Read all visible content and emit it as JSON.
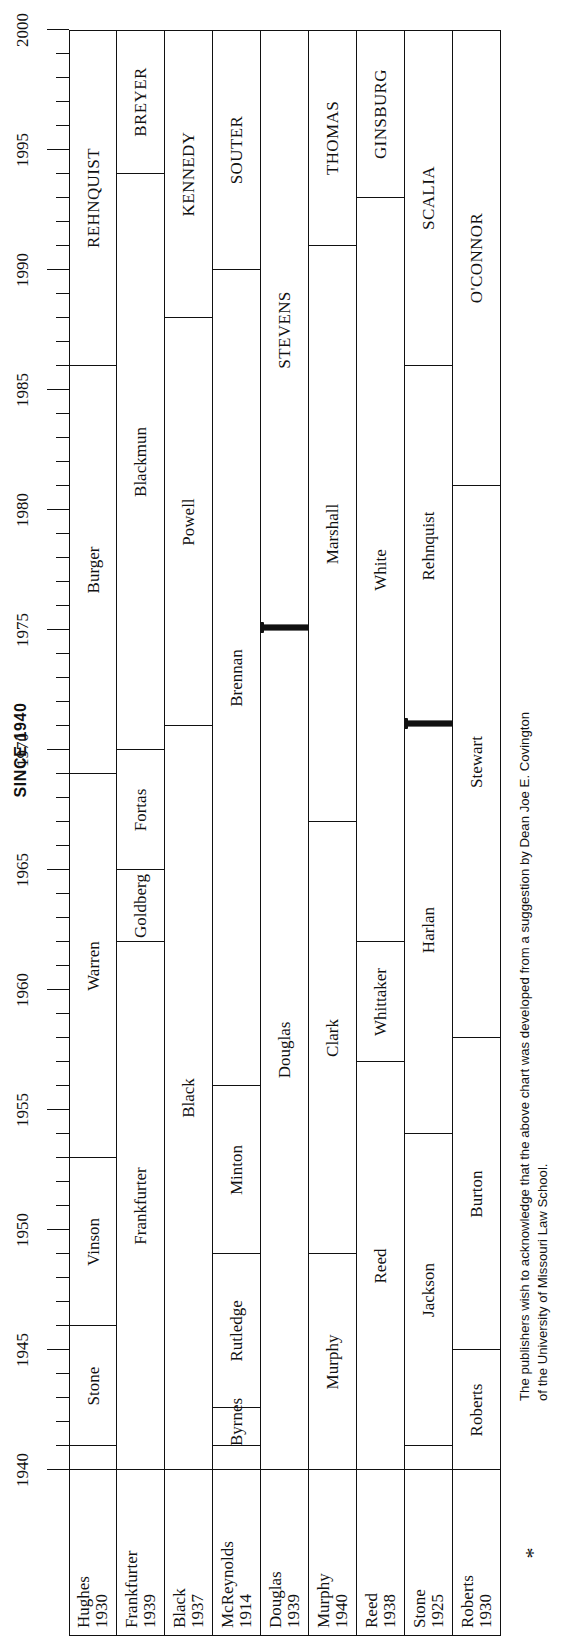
{
  "title": "SINCE 1940",
  "asterisk": "*",
  "footnote": "The publishers wish to acknowledge that the above chart was developed from a suggestion by Dean Joe E. Covington of the University of Missouri Law School.",
  "colors": {
    "ink": "#111111",
    "paper": "#ffffff"
  },
  "chart_data": {
    "type": "table",
    "title": "SINCE 1940",
    "xlabel": "",
    "ylabel": "",
    "xlim": [
      1940,
      2000
    ],
    "grid": false,
    "legend": "none",
    "x_major_ticks": [
      1940,
      1945,
      1950,
      1955,
      1960,
      1965,
      1970,
      1975,
      1980,
      1985,
      1990,
      1995,
      2000
    ],
    "x_minor_tick_step": 1,
    "tick_labels": [
      "1940",
      "1945",
      "1950",
      "1955",
      "1960",
      "1965",
      "1970",
      "1975",
      "1980",
      "1985",
      "1990",
      "1995",
      "2000"
    ],
    "seat_label_header": [
      "justice",
      "appointed"
    ],
    "series": [
      {
        "name": "Seat 1",
        "label_name": "Hughes",
        "label_year": "1930",
        "terms": [
          {
            "name": "Hughes",
            "start": 1940,
            "end": 1941,
            "style": "normal",
            "label_shown": false
          },
          {
            "name": "Stone",
            "start": 1941,
            "end": 1946,
            "style": "normal"
          },
          {
            "name": "Vinson",
            "start": 1946,
            "end": 1953,
            "style": "normal"
          },
          {
            "name": "Warren",
            "start": 1953,
            "end": 1969,
            "style": "normal"
          },
          {
            "name": "Burger",
            "start": 1969,
            "end": 1986,
            "style": "normal"
          },
          {
            "name": "REHNQUIST",
            "start": 1986,
            "end": 2000,
            "style": "caps"
          }
        ]
      },
      {
        "name": "Seat 2",
        "label_name": "Frankfurter",
        "label_year": "1939",
        "terms": [
          {
            "name": "Frankfurter",
            "start": 1940,
            "end": 1962,
            "style": "normal",
            "label_shown": false
          },
          {
            "name": "Goldberg",
            "start": 1962,
            "end": 1965,
            "style": "normal"
          },
          {
            "name": "Fortas",
            "start": 1965,
            "end": 1970,
            "style": "normal"
          },
          {
            "name": "Blackmun",
            "start": 1970,
            "end": 1994,
            "style": "normal"
          },
          {
            "name": "BREYER",
            "start": 1994,
            "end": 2000,
            "style": "caps"
          }
        ]
      },
      {
        "name": "Seat 3",
        "label_name": "Black",
        "label_year": "1937",
        "terms": [
          {
            "name": "Black",
            "start": 1940,
            "end": 1971,
            "style": "normal",
            "label_shown": false
          },
          {
            "name": "Powell",
            "start": 1971,
            "end": 1988,
            "style": "normal"
          },
          {
            "name": "KENNEDY",
            "start": 1988,
            "end": 2000,
            "style": "caps"
          }
        ]
      },
      {
        "name": "Seat 4",
        "label_name": "McReynolds",
        "label_year": "1914",
        "terms": [
          {
            "name": "McReynolds",
            "start": 1940,
            "end": 1941,
            "style": "normal"
          },
          {
            "name": "Byrnes",
            "start": 1941,
            "end": 1942.6,
            "style": "normal"
          },
          {
            "name": "Rutledge",
            "start": 1942.6,
            "end": 1949,
            "style": "normal"
          },
          {
            "name": "Minton",
            "start": 1949,
            "end": 1956,
            "style": "normal"
          },
          {
            "name": "Brennan",
            "start": 1956,
            "end": 1990,
            "style": "normal"
          },
          {
            "name": "SOUTER",
            "start": 1990,
            "end": 2000,
            "style": "caps"
          }
        ]
      },
      {
        "name": "Seat 5",
        "label_name": "Douglas",
        "label_year": "1939",
        "terms": [
          {
            "name": "Douglas",
            "start": 1940,
            "end": 1975,
            "style": "normal",
            "label_shown": false
          },
          {
            "name": "STEVENS",
            "start": 1975,
            "end": 2000,
            "style": "caps",
            "boundary": "bold"
          }
        ]
      },
      {
        "name": "Seat 6",
        "label_name": "Murphy",
        "label_year": "1940",
        "terms": [
          {
            "name": "Murphy",
            "start": 1940,
            "end": 1949,
            "style": "normal",
            "label_shown": false
          },
          {
            "name": "Clark",
            "start": 1949,
            "end": 1967,
            "style": "normal"
          },
          {
            "name": "Marshall",
            "start": 1967,
            "end": 1991,
            "style": "normal"
          },
          {
            "name": "THOMAS",
            "start": 1991,
            "end": 2000,
            "style": "caps"
          }
        ]
      },
      {
        "name": "Seat 7",
        "label_name": "Reed",
        "label_year": "1938",
        "terms": [
          {
            "name": "Reed",
            "start": 1940,
            "end": 1957,
            "style": "normal",
            "label_shown": false
          },
          {
            "name": "Whittaker",
            "start": 1957,
            "end": 1962,
            "style": "normal"
          },
          {
            "name": "White",
            "start": 1962,
            "end": 1993,
            "style": "normal"
          },
          {
            "name": "GINSBURG",
            "start": 1993,
            "end": 2000,
            "style": "caps"
          }
        ]
      },
      {
        "name": "Seat 8",
        "label_name": "Stone",
        "label_year": "1925",
        "terms": [
          {
            "name": "Stone",
            "start": 1940,
            "end": 1941,
            "style": "normal",
            "label_shown": false
          },
          {
            "name": "Jackson",
            "start": 1941,
            "end": 1954,
            "style": "normal"
          },
          {
            "name": "Harlan",
            "start": 1954,
            "end": 1971,
            "style": "normal"
          },
          {
            "name": "Rehnquist",
            "start": 1971,
            "end": 1986,
            "style": "normal",
            "boundary": "bold"
          },
          {
            "name": "SCALIA",
            "start": 1986,
            "end": 2000,
            "style": "caps"
          }
        ]
      },
      {
        "name": "Seat 9",
        "label_name": "Roberts",
        "label_year": "1930",
        "terms": [
          {
            "name": "Roberts",
            "start": 1940,
            "end": 1945,
            "style": "normal",
            "label_shown": false
          },
          {
            "name": "Burton",
            "start": 1945,
            "end": 1958,
            "style": "normal"
          },
          {
            "name": "Stewart",
            "start": 1958,
            "end": 1981,
            "style": "normal"
          },
          {
            "name": "O'CONNOR",
            "start": 1981,
            "end": 2000,
            "style": "caps"
          }
        ]
      }
    ]
  }
}
